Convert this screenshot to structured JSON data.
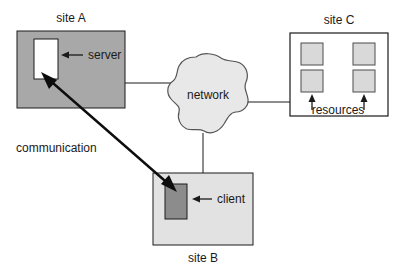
{
  "diagram": {
    "colors": {
      "site_a_fill": "#a8a8a8",
      "site_b_fill": "#e2e2e2",
      "site_c_fill": "#ffffff",
      "server_fill": "#ffffff",
      "client_fill": "#8c8c8c",
      "resource_fill": "#d9d9d9",
      "cloud_fill": "#e8e8e8",
      "stroke": "#1a1a1a",
      "text": "#1a1a1a",
      "background": "#ffffff"
    },
    "nodes": {
      "site_a": {
        "label": "site A",
        "inner_label": "server",
        "x": 17,
        "y": 31,
        "w": 108,
        "h": 77
      },
      "site_b": {
        "label": "site B",
        "inner_label": "client",
        "x": 153,
        "y": 173,
        "w": 100,
        "h": 72
      },
      "site_c": {
        "label": "site C",
        "inner_label": "resources",
        "x": 290,
        "y": 33,
        "w": 98,
        "h": 83
      },
      "network": {
        "label": "network"
      }
    },
    "edges": {
      "communication_label": "communication"
    }
  }
}
